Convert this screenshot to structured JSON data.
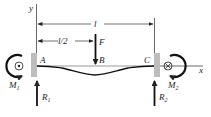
{
  "diagram": {
    "axes": {
      "y_label": "y",
      "x_label": "x"
    },
    "dimensions": {
      "full_span": "l",
      "half_span": "l/2"
    },
    "load": {
      "label": "F"
    },
    "points": {
      "a": "A",
      "b": "B",
      "c": "C"
    },
    "moments": {
      "left": {
        "label": "M",
        "sub": "1"
      },
      "right": {
        "label": "M",
        "sub": "2"
      }
    },
    "reactions": {
      "left": {
        "label": "R",
        "sub": "1"
      },
      "right": {
        "label": "R",
        "sub": "2"
      }
    },
    "colors": {
      "ink": "#111111",
      "wall": "#bdbdbd",
      "line": "#333333"
    }
  }
}
